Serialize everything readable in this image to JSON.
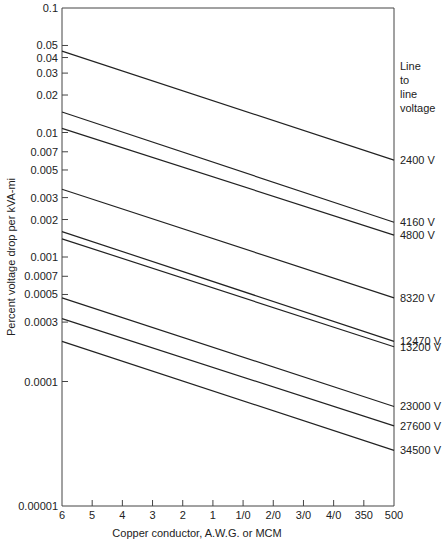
{
  "chart_data": {
    "type": "line",
    "title": "",
    "xlabel": "Copper conductor, A.W.G. or MCM",
    "ylabel": "Percent voltage drop per kVA-mi",
    "yscale": "log",
    "ylim": [
      1e-05,
      0.1
    ],
    "x_categories": [
      "6",
      "5",
      "4",
      "3",
      "2",
      "1",
      "1/0",
      "2/0",
      "3/0",
      "4/0",
      "350",
      "500"
    ],
    "y_ticks": [
      {
        "value": 0.1,
        "label": "0.1"
      },
      {
        "value": 0.05,
        "label": "0.05"
      },
      {
        "value": 0.04,
        "label": "0.04"
      },
      {
        "value": 0.03,
        "label": "0.03"
      },
      {
        "value": 0.02,
        "label": "0.02"
      },
      {
        "value": 0.01,
        "label": "0.01"
      },
      {
        "value": 0.007,
        "label": "0.007"
      },
      {
        "value": 0.005,
        "label": "0.005"
      },
      {
        "value": 0.003,
        "label": "0.003"
      },
      {
        "value": 0.002,
        "label": "0.002"
      },
      {
        "value": 0.001,
        "label": "0.001"
      },
      {
        "value": 0.0007,
        "label": "0.0007"
      },
      {
        "value": 0.0005,
        "label": "0.0005"
      },
      {
        "value": 0.0003,
        "label": "0.0003"
      },
      {
        "value": 0.0001,
        "label": "0.0001"
      },
      {
        "value": 1e-05,
        "label": "0.00001"
      }
    ],
    "legend_title": [
      "Line",
      "to",
      "line",
      "voltage"
    ],
    "legend_position": "right",
    "grid": false,
    "series": [
      {
        "name": "2400 V",
        "start": 0.045,
        "end": 0.006
      },
      {
        "name": "4160 V",
        "start": 0.0146,
        "end": 0.0019
      },
      {
        "name": "4800 V",
        "start": 0.0108,
        "end": 0.0015
      },
      {
        "name": "8320 V",
        "start": 0.0035,
        "end": 0.00047
      },
      {
        "name": "12470 V",
        "start": 0.0016,
        "end": 0.00021
      },
      {
        "name": "13200 V",
        "start": 0.0014,
        "end": 0.00019
      },
      {
        "name": "23000 V",
        "start": 0.00047,
        "end": 6.3e-05
      },
      {
        "name": "27600 V",
        "start": 0.00032,
        "end": 4.4e-05
      },
      {
        "name": "34500 V",
        "start": 0.00021,
        "end": 2.8e-05
      }
    ]
  },
  "colors": {
    "line": "#222222",
    "axis": "#444444",
    "background": "#ffffff"
  }
}
